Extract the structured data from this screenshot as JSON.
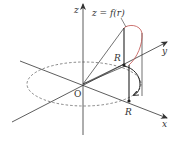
{
  "diagram": {
    "labels": {
      "z_axis": "z",
      "x_axis": "x",
      "y_axis": "y",
      "origin": "O",
      "function": "z = f(r)",
      "radius_x": "R",
      "radius_y": "R"
    },
    "colors": {
      "axis": "#333333",
      "curve": "#c0504d",
      "dashed_circle": "#555555",
      "background": "#ffffff"
    }
  }
}
